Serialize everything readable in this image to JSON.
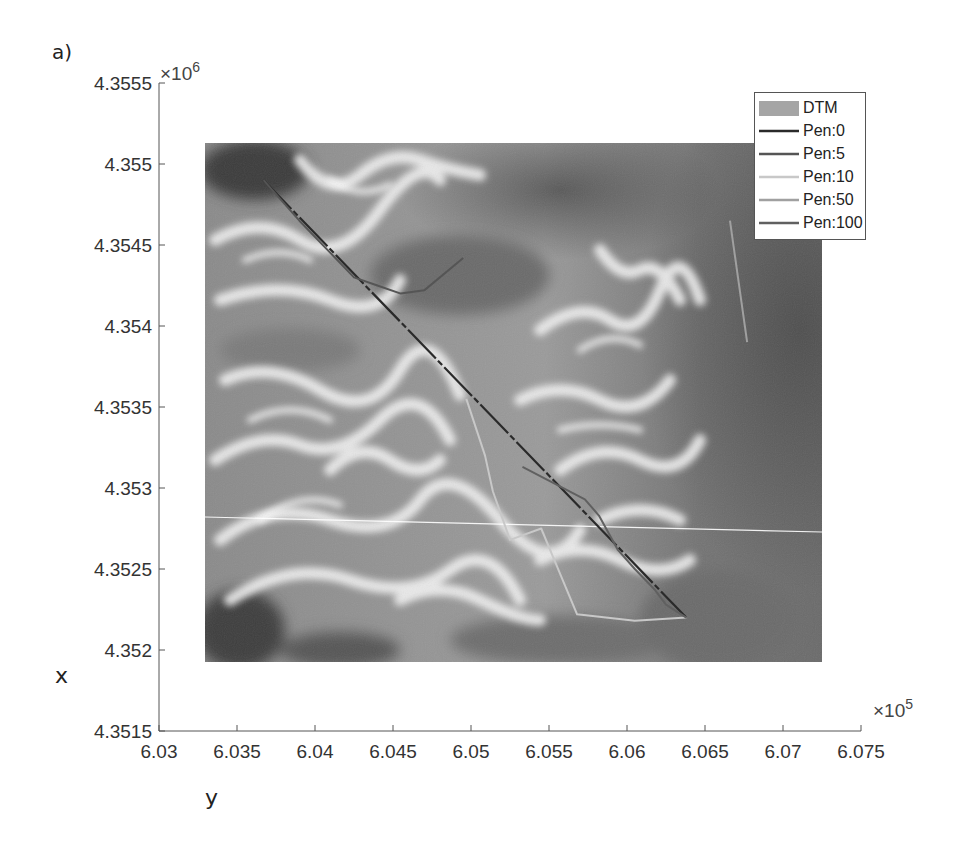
{
  "figure": {
    "panel_label": "a)",
    "xlabel": "y",
    "ylabel": "x",
    "x_exponent": "×10",
    "x_exponent_power": "5",
    "y_exponent": "×10",
    "y_exponent_power": "6"
  },
  "chart_data": {
    "type": "line",
    "title": "",
    "xlabel": "y",
    "ylabel": "x",
    "x_multiplier": 100000,
    "y_multiplier": 1000000,
    "xlim": [
      6.03,
      6.075
    ],
    "ylim": [
      4.3515,
      4.3555
    ],
    "x_ticks": [
      "6.03",
      "6.035",
      "6.04",
      "6.045",
      "6.05",
      "6.055",
      "6.06",
      "6.065",
      "6.07",
      "6.075"
    ],
    "y_ticks": [
      "4.3515",
      "4.352",
      "4.3525",
      "4.353",
      "4.3535",
      "4.354",
      "4.3545",
      "4.355",
      "4.3555"
    ],
    "grid": false,
    "legend_position": "upper right",
    "background_raster": {
      "name": "DTM",
      "colormap": "gray",
      "extent_x": [
        6.0333,
        6.072
      ],
      "extent_y": [
        4.35195,
        4.35512
      ]
    },
    "legend": [
      "DTM",
      "Pen:0",
      "Pen:5",
      "Pen:10",
      "Pen:50",
      "Pen:100"
    ],
    "series": [
      {
        "name": "Pen:0",
        "color": "#2a2a2a",
        "style": "solid",
        "x": [
          6.0367,
          6.0638
        ],
        "y": [
          4.3549,
          4.3522
        ]
      },
      {
        "name": "Pen:5",
        "color": "#555555",
        "style": "solid",
        "x": [
          6.0367,
          6.039,
          6.041,
          6.0425,
          6.044,
          6.0455,
          6.047,
          6.0495
        ],
        "y": [
          4.3549,
          4.35465,
          4.35445,
          4.3543,
          4.35425,
          4.3542,
          4.35422,
          4.35442
        ]
      },
      {
        "name": "Pen:10",
        "color": "#c8c8c8",
        "style": "solid",
        "x": [
          6.0497,
          6.0509,
          6.0514,
          6.0525,
          6.0545,
          6.0558,
          6.0568,
          6.0605,
          6.0638
        ],
        "y": [
          4.35355,
          4.3532,
          4.35298,
          4.35268,
          4.35275,
          4.35245,
          4.35222,
          4.35218,
          4.3522
        ]
      },
      {
        "name": "Pen:50",
        "color": "#a0a0a0",
        "style": "solid",
        "x": [
          6.0666,
          6.0677
        ],
        "y": [
          4.35465,
          4.3539
        ]
      },
      {
        "name": "Pen:100",
        "color": "#606060",
        "style": "solid",
        "x": [
          6.0533,
          6.0573,
          6.0582,
          6.0594,
          6.0605,
          6.0618,
          6.0625,
          6.0638
        ],
        "y": [
          4.35313,
          4.35293,
          4.35283,
          4.35262,
          4.3525,
          4.35237,
          4.35228,
          4.3522
        ]
      }
    ]
  }
}
